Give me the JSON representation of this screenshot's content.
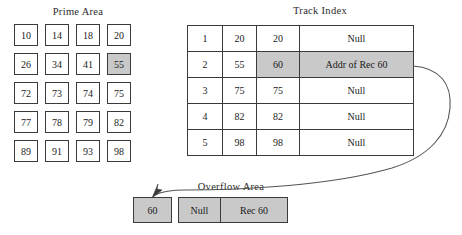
{
  "diagram": {
    "background_color": "#ffffff",
    "line_color": "#3a3a3a",
    "highlight_color": "#c9c9c9"
  },
  "prime_area": {
    "title": "Prime Area",
    "rows": [
      [
        {
          "value": "10",
          "highlighted": false
        },
        {
          "value": "14",
          "highlighted": false
        },
        {
          "value": "18",
          "highlighted": false
        },
        {
          "value": "20",
          "highlighted": false
        }
      ],
      [
        {
          "value": "26",
          "highlighted": false
        },
        {
          "value": "34",
          "highlighted": false
        },
        {
          "value": "41",
          "highlighted": false
        },
        {
          "value": "55",
          "highlighted": true
        }
      ],
      [
        {
          "value": "72",
          "highlighted": false
        },
        {
          "value": "73",
          "highlighted": false
        },
        {
          "value": "74",
          "highlighted": false
        },
        {
          "value": "75",
          "highlighted": false
        }
      ],
      [
        {
          "value": "77",
          "highlighted": false
        },
        {
          "value": "78",
          "highlighted": false
        },
        {
          "value": "79",
          "highlighted": false
        },
        {
          "value": "82",
          "highlighted": false
        }
      ],
      [
        {
          "value": "89",
          "highlighted": false
        },
        {
          "value": "91",
          "highlighted": false
        },
        {
          "value": "93",
          "highlighted": false
        },
        {
          "value": "98",
          "highlighted": false
        }
      ]
    ]
  },
  "track_index": {
    "title": "Track Index",
    "rows": [
      {
        "track": "1",
        "prime_key": "20",
        "overflow_key": "20",
        "overflow_addr": "Null",
        "highlighted": false
      },
      {
        "track": "2",
        "prime_key": "55",
        "overflow_key": "60",
        "overflow_addr": "Addr of Rec 60",
        "highlighted": true
      },
      {
        "track": "3",
        "prime_key": "75",
        "overflow_key": "75",
        "overflow_addr": "Null",
        "highlighted": false
      },
      {
        "track": "4",
        "prime_key": "82",
        "overflow_key": "82",
        "overflow_addr": "Null",
        "highlighted": false
      },
      {
        "track": "5",
        "prime_key": "98",
        "overflow_key": "98",
        "overflow_addr": "Null",
        "highlighted": false
      }
    ]
  },
  "overflow_area": {
    "title": "Overflow Area",
    "key_box": "60",
    "record": {
      "link": "Null",
      "data": "Rec 60"
    }
  }
}
